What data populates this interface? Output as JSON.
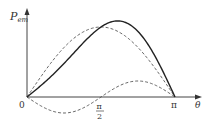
{
  "chart_data": {
    "type": "line",
    "title": "",
    "xlabel": "θ",
    "ylabel": "P_em",
    "ylabel_main": "P",
    "ylabel_sub": "em",
    "x_ticks": [
      {
        "value": 0,
        "label": "0"
      },
      {
        "value": 1.5708,
        "label_num": "π",
        "label_den": "2"
      },
      {
        "value": 3.1416,
        "label": "π"
      }
    ],
    "xlim": [
      0,
      3.1416
    ],
    "grid": false,
    "legend": null,
    "series": [
      {
        "name": "P_em (resultant)",
        "style": "solid",
        "description": "sum of sinθ and sin2θ components",
        "peak_x": 1.96,
        "peak_y": 1.0
      },
      {
        "name": "sinθ component",
        "style": "dashed",
        "peak_x": 1.5708,
        "peak_y": 0.9
      },
      {
        "name": "sin2θ component",
        "style": "dashed",
        "min_x": 0.785,
        "min_y": -0.2,
        "max_x": 2.356,
        "max_y": 0.23
      }
    ]
  },
  "labels": {
    "origin": "0",
    "pi": "π",
    "half_pi_num": "π",
    "half_pi_den": "2",
    "theta": "θ",
    "p": "P",
    "em": "em"
  }
}
